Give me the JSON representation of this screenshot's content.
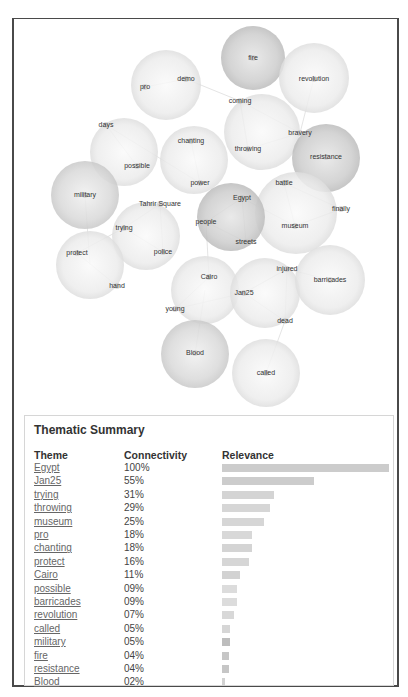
{
  "chart_data": [
    {
      "type": "bubble-network",
      "title": "",
      "bubbles": [
        {
          "id": "fire",
          "cx": 253,
          "cy": 58,
          "r": 32,
          "shade": "dark",
          "labels": [
            {
              "text": "fire",
              "x": 253,
              "y": 60
            }
          ]
        },
        {
          "id": "revolution",
          "cx": 314,
          "cy": 78,
          "r": 35,
          "shade": "light",
          "labels": [
            {
              "text": "revolution",
              "x": 314,
              "y": 81
            }
          ]
        },
        {
          "id": "pro-demo",
          "cx": 166,
          "cy": 85,
          "r": 35,
          "shade": "light",
          "labels": [
            {
              "text": "demo",
              "x": 186,
              "y": 81
            },
            {
              "text": "pro",
              "x": 145,
              "y": 89
            }
          ]
        },
        {
          "id": "coming-throwing",
          "cx": 262,
          "cy": 132,
          "r": 38,
          "shade": "light",
          "labels": [
            {
              "text": "coming",
              "x": 240,
              "y": 103
            },
            {
              "text": "throwing",
              "x": 248,
              "y": 151
            },
            {
              "text": "bravery",
              "x": 300,
              "y": 135
            }
          ]
        },
        {
          "id": "days-possible",
          "cx": 124,
          "cy": 152,
          "r": 34,
          "shade": "light",
          "labels": [
            {
              "text": "days",
              "x": 106,
              "y": 127
            },
            {
              "text": "possible",
              "x": 137,
              "y": 168
            }
          ]
        },
        {
          "id": "chanting-power",
          "cx": 194,
          "cy": 160,
          "r": 34,
          "shade": "light",
          "labels": [
            {
              "text": "chanting",
              "x": 191,
              "y": 143
            },
            {
              "text": "power",
              "x": 200,
              "y": 185
            }
          ]
        },
        {
          "id": "resistance",
          "cx": 326,
          "cy": 158,
          "r": 34,
          "shade": "dark",
          "labels": [
            {
              "text": "resistance",
              "x": 326,
              "y": 159
            }
          ]
        },
        {
          "id": "military",
          "cx": 85,
          "cy": 195,
          "r": 34,
          "shade": "medium",
          "labels": [
            {
              "text": "military",
              "x": 85,
              "y": 197
            }
          ]
        },
        {
          "id": "battle-museum",
          "cx": 296,
          "cy": 213,
          "r": 41,
          "shade": "light",
          "labels": [
            {
              "text": "battle",
              "x": 284,
              "y": 185
            },
            {
              "text": "finally",
              "x": 341,
              "y": 211
            },
            {
              "text": "museum",
              "x": 295,
              "y": 228
            }
          ]
        },
        {
          "id": "egypt",
          "cx": 231,
          "cy": 217,
          "r": 34,
          "shade": "dark",
          "labels": [
            {
              "text": "Egypt",
              "x": 242,
              "y": 200
            },
            {
              "text": "people",
              "x": 206,
              "y": 224
            },
            {
              "text": "streets",
              "x": 246,
              "y": 244
            }
          ]
        },
        {
          "id": "tahrir",
          "cx": 146,
          "cy": 236,
          "r": 34,
          "shade": "light",
          "labels": [
            {
              "text": "Tahrir Square",
              "x": 160,
              "y": 206
            },
            {
              "text": "trying",
              "x": 124,
              "y": 230
            },
            {
              "text": "police",
              "x": 163,
              "y": 254
            }
          ]
        },
        {
          "id": "protect-hand",
          "cx": 90,
          "cy": 265,
          "r": 34,
          "shade": "light",
          "labels": [
            {
              "text": "protect",
              "x": 77,
              "y": 255
            },
            {
              "text": "hand",
              "x": 117,
              "y": 288
            }
          ]
        },
        {
          "id": "cairo-young",
          "cx": 205,
          "cy": 290,
          "r": 34,
          "shade": "light",
          "labels": [
            {
              "text": "Cairo",
              "x": 209,
              "y": 279
            },
            {
              "text": "young",
              "x": 175,
              "y": 311
            }
          ]
        },
        {
          "id": "jan25",
          "cx": 265,
          "cy": 293,
          "r": 35,
          "shade": "light",
          "labels": [
            {
              "text": "injured",
              "x": 287,
              "y": 271
            },
            {
              "text": "Jan25",
              "x": 244,
              "y": 295
            },
            {
              "text": "dead",
              "x": 285,
              "y": 323
            }
          ]
        },
        {
          "id": "barricades",
          "cx": 330,
          "cy": 280,
          "r": 35,
          "shade": "light",
          "labels": [
            {
              "text": "barricades",
              "x": 330,
              "y": 282
            }
          ]
        },
        {
          "id": "blood",
          "cx": 195,
          "cy": 354,
          "r": 34,
          "shade": "medium",
          "labels": [
            {
              "text": "Blood",
              "x": 195,
              "y": 355
            }
          ]
        },
        {
          "id": "called",
          "cx": 266,
          "cy": 373,
          "r": 34,
          "shade": "light",
          "labels": [
            {
              "text": "called",
              "x": 266,
              "y": 375
            }
          ]
        }
      ]
    },
    {
      "type": "bar",
      "title": "Thematic Summary",
      "xlabel": "Relevance",
      "ylabel": "Theme",
      "categories": [
        "Egypt",
        "Jan25",
        "trying",
        "throwing",
        "museum",
        "pro",
        "chanting",
        "protect",
        "Cairo",
        "possible",
        "barricades",
        "revolution",
        "called",
        "military",
        "fire",
        "resistance",
        "Blood"
      ],
      "values": [
        100,
        55,
        31,
        29,
        25,
        18,
        18,
        16,
        11,
        9,
        9,
        7,
        5,
        5,
        4,
        4,
        2
      ],
      "connectivity_labels": [
        "100%",
        "55%",
        "31%",
        "29%",
        "25%",
        "18%",
        "18%",
        "16%",
        "11%",
        "09%",
        "09%",
        "07%",
        "05%",
        "05%",
        "04%",
        "04%",
        "02%"
      ],
      "ylim": [
        0,
        100
      ],
      "grid": false,
      "legend": null
    }
  ],
  "summary": {
    "title": "Thematic Summary",
    "headers": {
      "theme": "Theme",
      "connectivity": "Connectivity",
      "relevance": "Relevance"
    },
    "rows": [
      {
        "theme": "Egypt",
        "connectivity": "100%",
        "bar": 100,
        "color": "#cccccc"
      },
      {
        "theme": "Jan25",
        "connectivity": "55%",
        "bar": 55,
        "color": "#cccccc"
      },
      {
        "theme": "trying",
        "connectivity": "31%",
        "bar": 31,
        "color": "#d4d4d4"
      },
      {
        "theme": "throwing",
        "connectivity": "29%",
        "bar": 29,
        "color": "#d6d6d6"
      },
      {
        "theme": "museum",
        "connectivity": "25%",
        "bar": 25,
        "color": "#d6d6d6"
      },
      {
        "theme": "pro",
        "connectivity": "18%",
        "bar": 18,
        "color": "#d8d8d8"
      },
      {
        "theme": "chanting",
        "connectivity": "18%",
        "bar": 18,
        "color": "#d4d4d4"
      },
      {
        "theme": "protect",
        "connectivity": "16%",
        "bar": 16,
        "color": "#d6d6d6"
      },
      {
        "theme": "Cairo",
        "connectivity": "11%",
        "bar": 11,
        "color": "#d2d2d2"
      },
      {
        "theme": "possible",
        "connectivity": "09%",
        "bar": 9,
        "color": "#dcdcdc"
      },
      {
        "theme": "barricades",
        "connectivity": "09%",
        "bar": 9,
        "color": "#dcdcdc"
      },
      {
        "theme": "revolution",
        "connectivity": "07%",
        "bar": 7,
        "color": "#d8d8d8"
      },
      {
        "theme": "called",
        "connectivity": "05%",
        "bar": 5,
        "color": "#d6d6d6"
      },
      {
        "theme": "military",
        "connectivity": "05%",
        "bar": 5,
        "color": "#bdbdbd"
      },
      {
        "theme": "fire",
        "connectivity": "04%",
        "bar": 4,
        "color": "#c6c6c6"
      },
      {
        "theme": "resistance",
        "connectivity": "04%",
        "bar": 4,
        "color": "#c6c6c6"
      },
      {
        "theme": "Blood",
        "connectivity": "02%",
        "bar": 2,
        "color": "#d2d2d2"
      }
    ]
  },
  "colors": {
    "frame_border": "#4a4a4a",
    "summary_border": "#d6d6d6",
    "bubble_light": "#ededed",
    "bubble_medium": "#d8d8d8",
    "bubble_dark": "#c8c8c8",
    "link_text": "#666666"
  }
}
